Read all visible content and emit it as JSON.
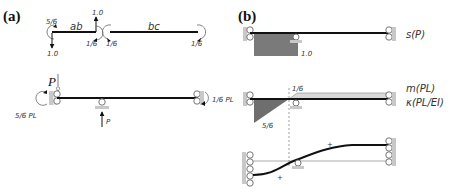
{
  "panels": {
    "a": {
      "label": "(a)",
      "free_body": {
        "segment_ab": {
          "label": "ab",
          "left_moment": "5/6",
          "left_force": "1.0",
          "right_force": "1.0",
          "right_moment": "1/6"
        },
        "segment_bc": {
          "label": "bc",
          "left_moment": "1/6",
          "right_moment": "1/6"
        }
      },
      "structure": {
        "load_label": "P",
        "left_reaction": "5/6 PL",
        "right_reaction": "1/6 PL",
        "support_reaction": "P"
      }
    },
    "b": {
      "label": "(b)",
      "shear": {
        "label": "s(P)",
        "value": "1.0"
      },
      "moment": {
        "label_m": "m(PL)",
        "label_k": "κ(PL/EI)",
        "top_value": "1/6",
        "bottom_value": "5/6"
      },
      "deflection": {
        "sign_upper": "+",
        "sign_lower": "+"
      }
    }
  },
  "colors": {
    "beam": "#111111",
    "shear_fill": "#7a7a7a",
    "moment_neg_fill": "#6e6e6e",
    "moment_pos_fill": "#d9d9d9",
    "wall": "#c8c8c8"
  }
}
